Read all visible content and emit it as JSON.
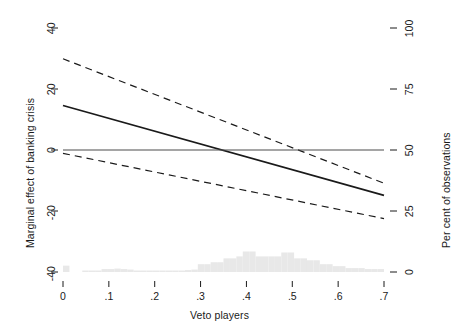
{
  "chart_data": {
    "type": "line",
    "title": "",
    "subtitle": "",
    "xlabel": "Veto players",
    "ylabel": "Marginal effect of banking crisis",
    "y2label": "Per cent of observations",
    "xlim": [
      0,
      0.7
    ],
    "ylim": [
      -40,
      40
    ],
    "y2lim": [
      0,
      100
    ],
    "xticks": [
      0,
      0.1,
      0.2,
      0.3,
      0.4,
      0.5,
      0.6,
      0.7
    ],
    "xticklabels": [
      "0",
      ".1",
      ".2",
      ".3",
      ".4",
      ".5",
      ".6",
      ".7"
    ],
    "yticks": [
      -40,
      -20,
      0,
      20,
      40
    ],
    "yticklabels": [
      "-40",
      "-20",
      "0",
      "20",
      "40"
    ],
    "y2ticks": [
      0,
      25,
      50,
      75,
      100
    ],
    "y2ticklabels": [
      "0",
      "25",
      "50",
      "75",
      "100"
    ],
    "grid": false,
    "legend": "none",
    "series": [
      {
        "name": "Marginal effect",
        "style": "solid",
        "color": "#1a1a1a",
        "width": 1.7,
        "x": [
          0,
          0.7
        ],
        "values": [
          14.6,
          -14.9
        ]
      },
      {
        "name": "Upper 95% confidence bound",
        "style": "dashed",
        "color": "#1a1a1a",
        "width": 1.2,
        "x": [
          0,
          0.7
        ],
        "values": [
          29.9,
          -10.9
        ]
      },
      {
        "name": "Lower 95% confidence bound",
        "style": "dashed",
        "color": "#1a1a1a",
        "width": 1.2,
        "x": [
          0,
          0.7
        ],
        "values": [
          -1.1,
          -22.5
        ]
      },
      {
        "name": "Zero reference line",
        "style": "solid",
        "color": "#4d4d4d",
        "width": 1.1,
        "x": [
          0,
          0.7
        ],
        "values": [
          0,
          0
        ]
      }
    ],
    "histogram": {
      "name": "Distribution of observations",
      "color": "#e8e8e8",
      "bin_width": 0.014,
      "y2_baseline": 0,
      "bins": [
        {
          "x0": 0.0,
          "pct": 2.6
        },
        {
          "x0": 0.014,
          "pct": 0.0
        },
        {
          "x0": 0.028,
          "pct": 0.0
        },
        {
          "x0": 0.042,
          "pct": 0.6
        },
        {
          "x0": 0.056,
          "pct": 0.6
        },
        {
          "x0": 0.07,
          "pct": 0.6
        },
        {
          "x0": 0.084,
          "pct": 1.2
        },
        {
          "x0": 0.098,
          "pct": 1.2
        },
        {
          "x0": 0.112,
          "pct": 1.4
        },
        {
          "x0": 0.126,
          "pct": 1.2
        },
        {
          "x0": 0.14,
          "pct": 1.0
        },
        {
          "x0": 0.154,
          "pct": 0.6
        },
        {
          "x0": 0.168,
          "pct": 0.6
        },
        {
          "x0": 0.182,
          "pct": 0.6
        },
        {
          "x0": 0.196,
          "pct": 0.6
        },
        {
          "x0": 0.21,
          "pct": 0.6
        },
        {
          "x0": 0.224,
          "pct": 0.6
        },
        {
          "x0": 0.238,
          "pct": 0.6
        },
        {
          "x0": 0.252,
          "pct": 0.6
        },
        {
          "x0": 0.266,
          "pct": 0.8
        },
        {
          "x0": 0.28,
          "pct": 1.0
        },
        {
          "x0": 0.294,
          "pct": 3.2
        },
        {
          "x0": 0.308,
          "pct": 3.2
        },
        {
          "x0": 0.322,
          "pct": 4.0
        },
        {
          "x0": 0.336,
          "pct": 4.0
        },
        {
          "x0": 0.35,
          "pct": 5.6
        },
        {
          "x0": 0.364,
          "pct": 5.6
        },
        {
          "x0": 0.378,
          "pct": 6.4
        },
        {
          "x0": 0.392,
          "pct": 8.4
        },
        {
          "x0": 0.406,
          "pct": 8.4
        },
        {
          "x0": 0.42,
          "pct": 6.4
        },
        {
          "x0": 0.434,
          "pct": 6.4
        },
        {
          "x0": 0.448,
          "pct": 6.4
        },
        {
          "x0": 0.462,
          "pct": 6.4
        },
        {
          "x0": 0.476,
          "pct": 8.0
        },
        {
          "x0": 0.49,
          "pct": 8.0
        },
        {
          "x0": 0.504,
          "pct": 5.6
        },
        {
          "x0": 0.518,
          "pct": 5.6
        },
        {
          "x0": 0.532,
          "pct": 4.8
        },
        {
          "x0": 0.546,
          "pct": 4.8
        },
        {
          "x0": 0.56,
          "pct": 3.2
        },
        {
          "x0": 0.574,
          "pct": 3.2
        },
        {
          "x0": 0.588,
          "pct": 2.4
        },
        {
          "x0": 0.602,
          "pct": 2.4
        },
        {
          "x0": 0.616,
          "pct": 1.6
        },
        {
          "x0": 0.63,
          "pct": 1.6
        },
        {
          "x0": 0.644,
          "pct": 1.6
        },
        {
          "x0": 0.658,
          "pct": 1.2
        },
        {
          "x0": 0.672,
          "pct": 1.2
        },
        {
          "x0": 0.686,
          "pct": 1.2
        }
      ]
    }
  },
  "axes": {
    "xlabel": "Veto players",
    "ylabel": "Marginal effect of banking crisis",
    "y2label": "Per cent of observations",
    "xticklabels": [
      "0",
      ".1",
      ".2",
      ".3",
      ".4",
      ".5",
      ".6",
      ".7"
    ],
    "yticklabels": [
      "-40",
      "-20",
      "0",
      "20",
      "40"
    ],
    "y2ticklabels": [
      "0",
      "25",
      "50",
      "75",
      "100"
    ]
  }
}
